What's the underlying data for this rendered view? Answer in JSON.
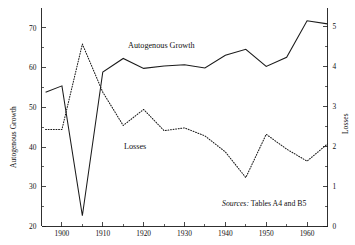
{
  "figure": {
    "background_color": "#ffffff",
    "ink_color": "#1a1a1a"
  },
  "labels": {
    "left_axis_title": "Autogenous Growth",
    "right_axis_title": "Losses",
    "series_solid_label": "Autogenous Growth",
    "series_dotted_label": "Losses",
    "source_keyword": "Sources:",
    "source_text": " Tables A4 and B5"
  },
  "chart_data": {
    "type": "line",
    "title": "",
    "subtitle": "",
    "xlabel": "",
    "ylabel": "Autogenous Growth",
    "y2label": "Losses",
    "grid": false,
    "legend": "inline-annotations",
    "xlim": [
      1895,
      1965
    ],
    "ylim": [
      20,
      75
    ],
    "y2lim": [
      0,
      5.45
    ],
    "xticks_major": [
      1900,
      1910,
      1920,
      1930,
      1940,
      1950,
      1960
    ],
    "xticks_minor": [
      1895,
      1905,
      1915,
      1925,
      1935,
      1945,
      1955,
      1965
    ],
    "xticklabels": [
      "1900",
      "1910",
      "1920",
      "1930",
      "1940",
      "1950",
      "1960"
    ],
    "yticks": [
      20,
      30,
      40,
      50,
      60,
      70
    ],
    "yticklabels": [
      "20",
      "30",
      "40",
      "50",
      "60",
      "70"
    ],
    "yticks_minor": [
      25,
      35,
      45,
      55,
      65
    ],
    "y2ticks": [
      0,
      1,
      2,
      3,
      4,
      5
    ],
    "y2ticklabels": [
      "0",
      "1",
      "2",
      "3",
      "4",
      "5"
    ],
    "y2ticks_minor": [
      0.5,
      1.5,
      2.5,
      3.5,
      4.5
    ],
    "series": [
      {
        "name": "Autogenous Growth",
        "style": "solid",
        "axis": "left",
        "x": [
          1896,
          1900,
          1905,
          1910,
          1915,
          1920,
          1925,
          1930,
          1935,
          1940,
          1945,
          1950,
          1955,
          1960,
          1965
        ],
        "values": [
          53.8,
          55.4,
          22.7,
          58.9,
          62.3,
          59.8,
          60.4,
          60.7,
          59.9,
          63.1,
          64.6,
          60.3,
          62.6,
          71.8,
          71.0
        ]
      },
      {
        "name": "Losses",
        "style": "dotted",
        "axis": "right",
        "x": [
          1896,
          1900,
          1905,
          1910,
          1915,
          1920,
          1925,
          1930,
          1935,
          1940,
          1945,
          1950,
          1955,
          1960,
          1965
        ],
        "values": [
          2.42,
          2.42,
          4.55,
          3.35,
          2.52,
          2.92,
          2.39,
          2.46,
          2.26,
          1.86,
          1.22,
          2.3,
          1.93,
          1.63,
          2.06
        ]
      }
    ],
    "annotations": [
      {
        "text": "Autogenous Growth",
        "x": 1925,
        "y": 66.5
      },
      {
        "text": "Losses",
        "x": 1919,
        "y": 41.5
      },
      {
        "text": "Sources: Tables A4 and B5",
        "x": 1948,
        "y": 24.5
      }
    ]
  }
}
